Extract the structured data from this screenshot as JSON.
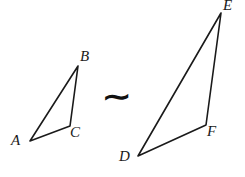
{
  "figure": {
    "type": "geometry-diagram",
    "background_color": "#ffffff",
    "stroke_color": "#1a1a1a",
    "canvas": {
      "width": 245,
      "height": 177
    }
  },
  "relation": {
    "symbol": "∼",
    "name": "similarity-symbol",
    "meaning": "is similar to"
  },
  "shapes": [
    {
      "name": "triangle-abc",
      "label": "ABC",
      "position": "left",
      "vertices": [
        {
          "label": "A",
          "x": 30,
          "y": 141,
          "label_x": 11,
          "label_y": 134
        },
        {
          "label": "B",
          "x": 78,
          "y": 66,
          "label_x": 80,
          "label_y": 50
        },
        {
          "label": "C",
          "x": 70,
          "y": 126,
          "label_x": 70,
          "label_y": 126
        }
      ],
      "path": "M 30 141 L 78 66 L 70 126 Z"
    },
    {
      "name": "triangle-def",
      "label": "DEF",
      "position": "right",
      "vertices": [
        {
          "label": "D",
          "x": 138,
          "y": 156,
          "label_x": 119,
          "label_y": 150
        },
        {
          "label": "E",
          "x": 221,
          "y": 13,
          "label_x": 224,
          "label_y": -2
        },
        {
          "label": "F",
          "x": 206,
          "y": 125,
          "label_x": 207,
          "label_y": 125
        }
      ],
      "path": "M 138 156 L 221 13 L 206 125 Z"
    }
  ],
  "labels": {
    "a": "A",
    "b": "B",
    "c": "C",
    "d": "D",
    "e": "E",
    "f": "F"
  }
}
